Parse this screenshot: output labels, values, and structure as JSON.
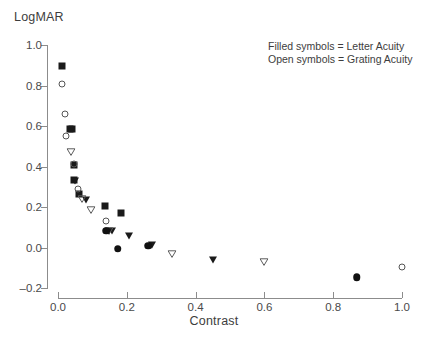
{
  "chart_data": {
    "type": "scatter",
    "title": "",
    "ylabel": "LogMAR",
    "xlabel": "Contrast",
    "xlim": [
      0.0,
      1.0
    ],
    "ylim": [
      -0.2,
      1.0
    ],
    "xticks": [
      "0.0",
      "0.2",
      "0.4",
      "0.6",
      "0.8",
      "1.0"
    ],
    "xtick_values": [
      0.0,
      0.2,
      0.4,
      0.6,
      0.8,
      1.0
    ],
    "yticks": [
      "1.0",
      "0.8",
      "0.6",
      "0.4",
      "0.2",
      "0.0",
      "-0.2"
    ],
    "ytick_values": [
      1.0,
      0.8,
      0.6,
      0.4,
      0.2,
      0.0,
      -0.2
    ],
    "grid": false,
    "legend_position": "top-right",
    "legend_lines": [
      "Filled symbols = Letter Acuity",
      "Open symbols = Grating Acuity"
    ],
    "marker_colors": {
      "filled": "#1a1a1a",
      "open_edge": "#555555",
      "axis": "#8c8c8c",
      "text": "#3d3d3d"
    },
    "series": [
      {
        "name": "Letter Acuity (filled square)",
        "marker": "square-filled",
        "points": [
          {
            "x": 0.013,
            "y": 0.895
          },
          {
            "x": 0.034,
            "y": 0.585
          },
          {
            "x": 0.041,
            "y": 0.585
          },
          {
            "x": 0.046,
            "y": 0.405
          },
          {
            "x": 0.047,
            "y": 0.335
          },
          {
            "x": 0.062,
            "y": 0.265
          },
          {
            "x": 0.138,
            "y": 0.205
          },
          {
            "x": 0.182,
            "y": 0.17
          }
        ]
      },
      {
        "name": "Grating Acuity (open circle)",
        "marker": "circle-open",
        "points": [
          {
            "x": 0.013,
            "y": 0.805
          },
          {
            "x": 0.021,
            "y": 0.66
          },
          {
            "x": 0.023,
            "y": 0.55
          },
          {
            "x": 0.046,
            "y": 0.41
          },
          {
            "x": 0.058,
            "y": 0.29
          },
          {
            "x": 0.14,
            "y": 0.13
          },
          {
            "x": 1.0,
            "y": -0.098
          }
        ]
      },
      {
        "name": "Letter Acuity (filled triangle)",
        "marker": "triangle-down-filled",
        "points": [
          {
            "x": 0.05,
            "y": 0.33
          },
          {
            "x": 0.08,
            "y": 0.235
          },
          {
            "x": 0.157,
            "y": 0.08
          },
          {
            "x": 0.207,
            "y": 0.055
          },
          {
            "x": 0.272,
            "y": 0.01
          },
          {
            "x": 0.45,
            "y": -0.06
          }
        ]
      },
      {
        "name": "Grating Acuity (open triangle)",
        "marker": "triangle-down-open",
        "points": [
          {
            "x": 0.038,
            "y": 0.47
          },
          {
            "x": 0.07,
            "y": 0.24
          },
          {
            "x": 0.096,
            "y": 0.185
          },
          {
            "x": 0.147,
            "y": 0.082
          },
          {
            "x": 0.33,
            "y": -0.03
          },
          {
            "x": 0.6,
            "y": -0.072
          }
        ]
      },
      {
        "name": "Letter Acuity (filled circle)",
        "marker": "circle-filled",
        "points": [
          {
            "x": 0.14,
            "y": 0.083
          },
          {
            "x": 0.174,
            "y": -0.005
          },
          {
            "x": 0.262,
            "y": 0.008
          },
          {
            "x": 0.868,
            "y": -0.148
          }
        ]
      }
    ]
  }
}
